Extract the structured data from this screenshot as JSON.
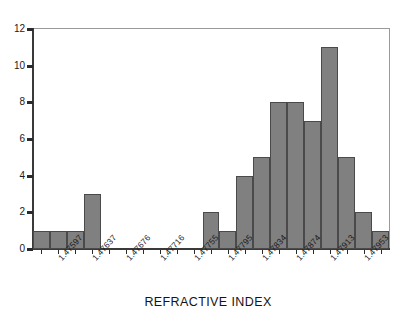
{
  "chart_data": {
    "type": "bar",
    "title": "",
    "subtitle": "",
    "xlabel": "REFRACTIVE INDEX",
    "ylabel": "",
    "ylim": [
      0,
      12
    ],
    "yticks": [
      0,
      2,
      4,
      6,
      8,
      10,
      12
    ],
    "grid": false,
    "legend": null,
    "bar_color": "#808080",
    "bar_edge_color": "#4a4a4a",
    "frame_color": "#9a9a9a",
    "axis_color": "#3a3a3a",
    "bin_count": 21,
    "categories": [
      "bin-1",
      "bin-2",
      "bin-3",
      "bin-4",
      "bin-5",
      "bin-6",
      "bin-7",
      "bin-8",
      "bin-9",
      "bin-10",
      "bin-11",
      "bin-12",
      "bin-13",
      "bin-14",
      "bin-15",
      "bin-16",
      "bin-17",
      "bin-18",
      "bin-19",
      "bin-20",
      "bin-21"
    ],
    "values": [
      1,
      1,
      1,
      3,
      0,
      0,
      0,
      0,
      0,
      0,
      2,
      1,
      4,
      5,
      8,
      8,
      7,
      11,
      5,
      2,
      1
    ],
    "xtick_labels": [
      "1.47597",
      "1.47637",
      "1.47676",
      "1.47716",
      "1.47755",
      "1.47795",
      "1.47834",
      "1.47874",
      "1.47913",
      "1.47953"
    ],
    "xtick_label_bin_index": [
      1,
      3,
      5,
      7,
      9,
      11,
      13,
      15,
      17,
      19
    ]
  },
  "axis": {
    "y_labels": [
      "0",
      "2",
      "4",
      "6",
      "8",
      "10",
      "12"
    ],
    "x_title": "REFRACTIVE INDEX"
  }
}
